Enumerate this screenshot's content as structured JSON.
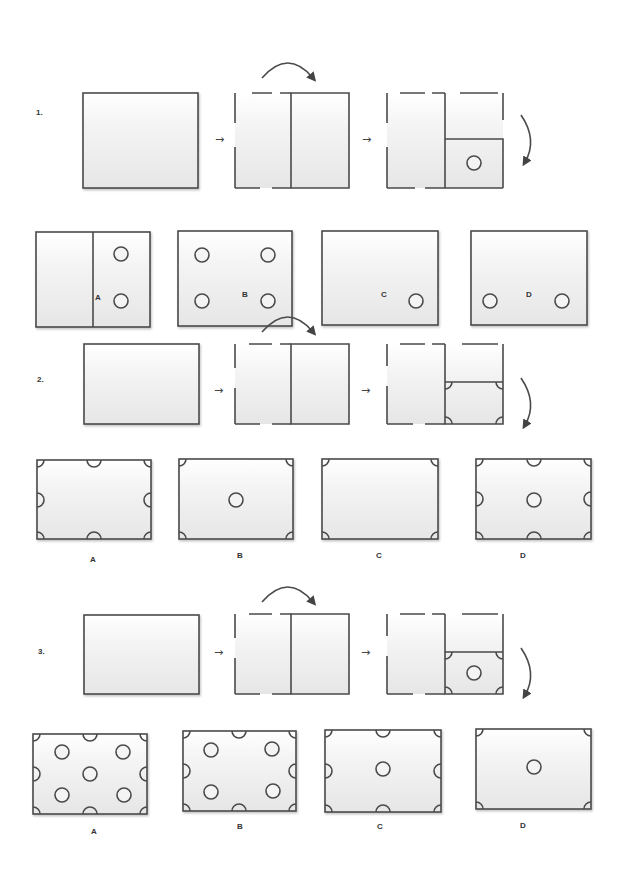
{
  "colors": {
    "stroke": "#4a4a4a",
    "fill_top": "#ffffff",
    "fill_bottom": "#e9e9e9",
    "text": "#333333"
  },
  "step_arrow_glyph": "→",
  "questions": [
    {
      "number": "1.",
      "folding_steps": [
        "unfolded-sheet",
        "folded-left-to-right",
        "folded-top-to-bottom-with-punch"
      ],
      "punch_description": "one hole punched in lower-right quarter",
      "options": [
        {
          "label": "A",
          "description": "divided sheet with two holes in right half"
        },
        {
          "label": "B",
          "description": "four holes"
        },
        {
          "label": "C",
          "description": "one hole lower right"
        },
        {
          "label": "D",
          "description": "two holes along bottom"
        }
      ]
    },
    {
      "number": "2.",
      "folding_steps": [
        "unfolded-sheet",
        "folded-left-to-right",
        "folded-top-to-bottom-with-corner-cuts"
      ],
      "punch_description": "quarter-circle cuts at four corners of folded square",
      "options": [
        {
          "label": "A",
          "description": "corner quarter-circles plus half-circles at edge midpoints"
        },
        {
          "label": "B",
          "description": "corner quarter-circles plus center hole"
        },
        {
          "label": "C",
          "description": "corner quarter-circles only"
        },
        {
          "label": "D",
          "description": "corners, edge half-circles and center hole"
        }
      ]
    },
    {
      "number": "3.",
      "folding_steps": [
        "unfolded-sheet",
        "folded-left-to-right",
        "folded-top-to-bottom-with-corner-cuts-and-hole"
      ],
      "punch_description": "corner quarter-circle cuts plus one central hole",
      "options": [
        {
          "label": "A",
          "description": "corners, edge half-circles, five holes"
        },
        {
          "label": "B",
          "description": "corners, edge half-circles, four holes"
        },
        {
          "label": "C",
          "description": "corners, edge half-circles, center hole"
        },
        {
          "label": "D",
          "description": "corners plus center hole"
        }
      ]
    }
  ]
}
